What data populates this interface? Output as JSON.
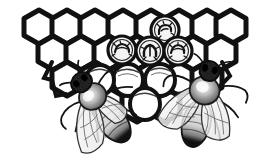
{
  "image": {
    "title": "Honeycomb with Two Honey Bees",
    "style": "vintage line engraving / woodcut",
    "width": 267,
    "height": 163,
    "background_color": "#ffffff",
    "ink_color": "#111111",
    "mid_tone_color": "#6b6b6b",
    "light_tone_color": "#c9c9c9"
  },
  "scene": {
    "subject": "honey bees on brood comb",
    "element_names": [
      "honeycomb",
      "capped-brood-cells",
      "open-cells",
      "bee-left",
      "bee-right"
    ]
  },
  "honeycomb": {
    "name": "honeycomb",
    "cell_shape": "hexagon",
    "wall_color": "#111111",
    "cell_fill": "#ffffff",
    "wall_thickness_px": 5,
    "cell_width_px": 30,
    "cell_height_px": 32,
    "rows": [
      {
        "row_index": 0,
        "cell_count": 8,
        "y": 12,
        "x_start": 24
      },
      {
        "row_index": 1,
        "cell_count": 7,
        "y": 40,
        "x_start": 39
      },
      {
        "row_index": 2,
        "cell_count": 6,
        "y": 68,
        "x_start": 54
      },
      {
        "row_index": 3,
        "cell_count": 3,
        "y": 96,
        "x_start": 99
      }
    ],
    "comb_left_px": 22,
    "comb_right_px": 246,
    "comb_top_px": 8,
    "comb_bottom_px": 120
  },
  "capped_brood_cells": {
    "name": "capped-brood-cells",
    "count": 4,
    "description": "round capped cells containing coiled larvae drawn as dark scribbles",
    "cap_outline_color": "#111111",
    "cap_fill": "#f2f2f2",
    "larva_color": "#1a1a1a",
    "cells": [
      {
        "id": "brood-cell-1",
        "cx": 165,
        "cy": 30,
        "r": 14
      },
      {
        "id": "brood-cell-2",
        "cx": 122,
        "cy": 50,
        "r": 14
      },
      {
        "id": "brood-cell-3",
        "cx": 150,
        "cy": 51,
        "r": 14
      },
      {
        "id": "brood-cell-4",
        "cx": 178,
        "cy": 51,
        "r": 14
      }
    ]
  },
  "open_cells": {
    "name": "open-cells",
    "count": 4,
    "description": "rounded open cell mouths below the capped brood, drawn with curved rims",
    "cells": [
      {
        "id": "open-cell-1",
        "cx": 128,
        "cy": 80,
        "rx": 15,
        "ry": 16
      },
      {
        "id": "open-cell-2",
        "cx": 160,
        "cy": 80,
        "rx": 15,
        "ry": 16
      },
      {
        "id": "open-cell-3",
        "cx": 145,
        "cy": 104,
        "rx": 15,
        "ry": 16
      },
      {
        "id": "open-cell-4",
        "cx": 100,
        "cy": 80,
        "rx": 14,
        "ry": 15
      }
    ]
  },
  "bee_left": {
    "name": "bee-left",
    "label": "worker bee (left)",
    "orientation": "diagonal, head upper-right, abdomen lower-left",
    "head": {
      "cx": 112,
      "cy": 78,
      "rx": 10,
      "ry": 9,
      "color": "#1c1c1c"
    },
    "thorax": {
      "cx": 101,
      "cy": 90,
      "rx": 13,
      "ry": 12,
      "color": "#8a8a8a"
    },
    "abdomen": {
      "cx": 80,
      "cy": 120,
      "rx": 14,
      "ry": 23,
      "color": "#d8d8d8",
      "tip_color": "#141414"
    },
    "wing_count": 2,
    "leg_count": 6,
    "antenna_count": 2,
    "rotation_deg": -38
  },
  "bee_right": {
    "name": "bee-right",
    "label": "worker bee (right)",
    "orientation": "near-vertical, head top, abdomen bottom",
    "head": {
      "cx": 196,
      "cy": 73,
      "rx": 9,
      "ry": 9,
      "color": "#1c1c1c"
    },
    "thorax": {
      "cx": 199,
      "cy": 90,
      "rx": 14,
      "ry": 14,
      "color": "#8a8a8a"
    },
    "abdomen": {
      "cx": 205,
      "cy": 122,
      "rx": 14,
      "ry": 23,
      "color": "#d8d8d8",
      "tip_color": "#141414"
    },
    "wing_count": 2,
    "leg_count": 6,
    "antenna_count": 2,
    "rotation_deg": 14
  }
}
